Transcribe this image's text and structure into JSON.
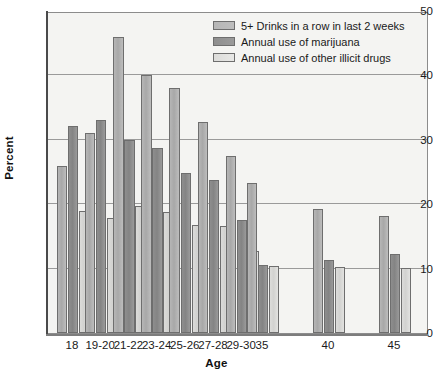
{
  "chart_data": {
    "type": "bar",
    "title": "",
    "xlabel": "Age",
    "ylabel": "Percent",
    "ylim": [
      0,
      50
    ],
    "yticks": [
      0,
      10,
      20,
      30,
      40,
      50
    ],
    "grid": true,
    "legend_position": "top-right",
    "categories": [
      "18",
      "19-20",
      "21-22",
      "23-24",
      "25-26",
      "27-28",
      "29-30",
      "35",
      "40",
      "45"
    ],
    "series": [
      {
        "name": "5+ Drinks in a row in last 2 weeks",
        "color": "#b6b6b6",
        "values": [
          26.0,
          31.0,
          46.0,
          40.0,
          38.0,
          32.8,
          27.5,
          23.3,
          19.3,
          18.1
        ]
      },
      {
        "name": "Annual use of marijuana",
        "color": "#8e8e8e",
        "values": [
          32.2,
          33.0,
          30.0,
          28.8,
          24.8,
          23.7,
          17.6,
          10.5,
          11.3,
          12.2
        ]
      },
      {
        "name": "Annual use of other illicit drugs",
        "color": "#dcdcda",
        "values": [
          19.0,
          17.9,
          19.8,
          18.8,
          16.8,
          16.6,
          12.8,
          10.4,
          10.3,
          10.1
        ]
      }
    ]
  },
  "axes": {
    "y_title": "Percent",
    "x_title": "Age"
  }
}
